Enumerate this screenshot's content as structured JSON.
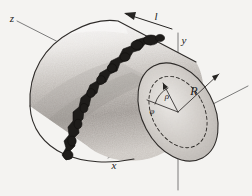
{
  "figure": {
    "kind": "technical-line-drawing",
    "background_color": "#f4f3f1",
    "ink_color": "#1e1c1a",
    "axis_color": "#6d6d6d",
    "shading_color": "#9a9795",
    "labels": {
      "axis_z": "z",
      "axis_y": "y",
      "axis_x": "x",
      "length": "l",
      "outer_radius": "R",
      "radial_coordinate": "ρ",
      "azimuthal_angle": "φ"
    },
    "icons": {
      "length_arrow": "left-arrow-icon",
      "radius_arrow": "radius-arrow-icon"
    },
    "elements": {
      "cylinder": "shaded cylinder drawn in oblique projection, rounded left end, elliptical right face",
      "crack": "jagged dark fracture band running around the cylinder surface near its middle",
      "end_face": "right elliptical end face with dashed inner ellipse",
      "dashed_circle": "dashed ellipse of radius rho inside the end face",
      "radius_arrow": "arrow from face centre to the rim labelled R",
      "rho_arrow": "short arrow from face centre to the dashed ellipse labelled rho",
      "angle_arc": "arc between the reference axis and the rho arrow labelled phi"
    }
  }
}
